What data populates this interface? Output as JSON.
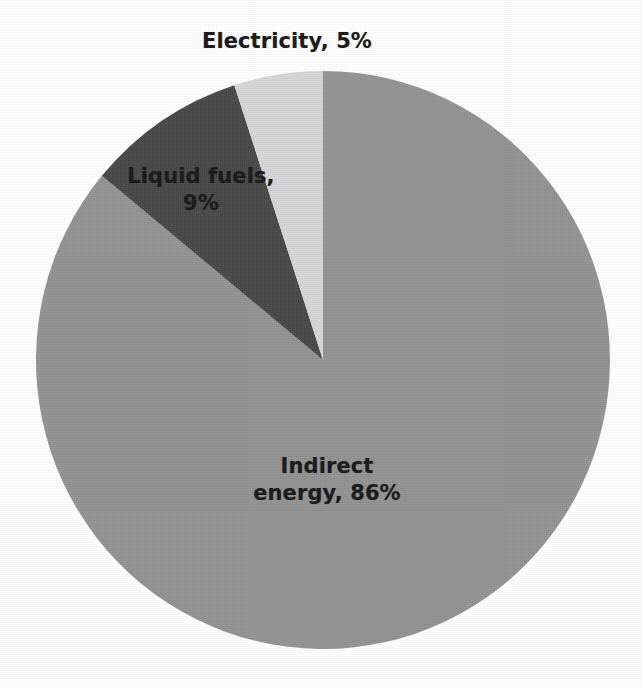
{
  "figure": {
    "background_color": "#fefefe",
    "label_text_color": "#1a1a1a"
  },
  "chart_data": {
    "type": "pie",
    "title": "",
    "subtitle": "",
    "xlabel": "",
    "ylabel": "",
    "legend_position": "none",
    "grid": false,
    "units": "percent",
    "total": 100,
    "start_angle_deg": 0,
    "direction": "clockwise",
    "categories": [
      "Indirect energy",
      "Liquid fuels",
      "Electricity"
    ],
    "values": [
      86,
      9,
      5
    ],
    "colors": [
      "#939393",
      "#4a4a4a",
      "#d6d6d6"
    ],
    "slices": [
      {
        "name": "Indirect energy",
        "value": 86,
        "label": "Indirect\nenergy, 86%",
        "color": "#939393",
        "start_deg": 0,
        "end_deg": 309.6,
        "label_position": "inside"
      },
      {
        "name": "Liquid fuels",
        "value": 9,
        "label": "Liquid fuels,\n9%",
        "color": "#4a4a4a",
        "start_deg": 309.6,
        "end_deg": 342.0,
        "label_position": "inside"
      },
      {
        "name": "Electricity",
        "value": 5,
        "label": "Electricity, 5%",
        "color": "#d6d6d6",
        "start_deg": 342.0,
        "end_deg": 360.0,
        "label_position": "outside-top"
      }
    ],
    "data_labels": [
      "Electricity, 5%",
      "Liquid fuels,\n9%",
      "Indirect\nenergy, 86%"
    ]
  },
  "labels": {
    "electricity": "Electricity, 5%",
    "liquid_fuels": "Liquid fuels,\n9%",
    "indirect_energy": "Indirect\nenergy, 86%"
  }
}
